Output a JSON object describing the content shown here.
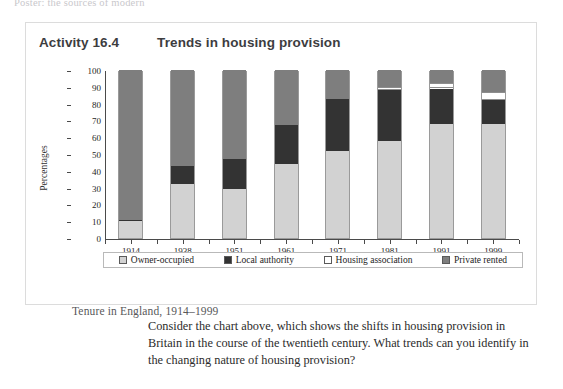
{
  "page": {
    "cutoff_header": "Poster: the sources of modern"
  },
  "panel": {
    "activity_label": "Activity 16.4",
    "title": "Trends in housing provision",
    "caption": "Tenure in England, 1914–1999",
    "question": "Consider the chart above, which shows the shifts in housing provision in Britain in the course of the twentieth century. What trends can you identify in the changing nature of housing provision?"
  },
  "chart_data": {
    "type": "bar",
    "stacked": true,
    "title": "Trends in housing provision",
    "subtitle": "Tenure in England, 1914–1999",
    "xlabel": "",
    "ylabel": "Percentages",
    "ylim": [
      0,
      100
    ],
    "yticks": [
      0,
      10,
      20,
      30,
      40,
      50,
      60,
      70,
      80,
      90,
      100
    ],
    "grid": false,
    "legend_position": "bottom",
    "categories": [
      "1914",
      "1938",
      "1951",
      "1961",
      "1971",
      "1981",
      "1991",
      "1999"
    ],
    "series": [
      {
        "name": "Owner-occupied",
        "color": "#d2d2d2",
        "values": [
          10,
          32,
          29,
          44,
          52,
          58,
          68,
          68
        ]
      },
      {
        "name": "Local authority",
        "color": "#333333",
        "values": [
          1,
          11,
          18,
          23,
          31,
          30,
          21,
          14
        ]
      },
      {
        "name": "Housing association",
        "color": "#ffffff",
        "values": [
          0,
          0,
          0,
          0,
          0,
          2,
          3,
          5
        ]
      },
      {
        "name": "Private rented",
        "color": "#7e7e7e",
        "values": [
          89,
          57,
          53,
          33,
          17,
          10,
          8,
          13
        ]
      }
    ]
  }
}
